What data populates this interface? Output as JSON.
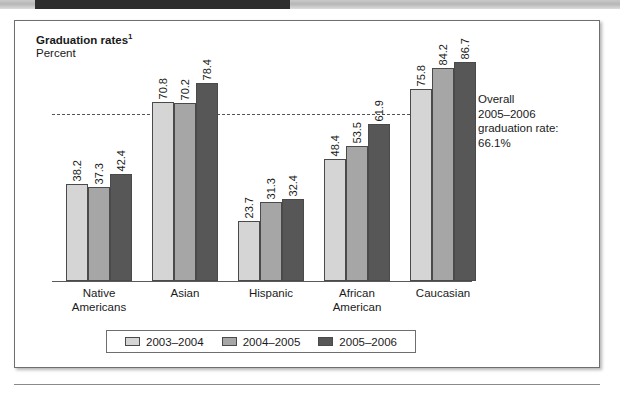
{
  "figure": {
    "title": "Graduation rates",
    "title_footnote": "1",
    "subtitle": "Percent"
  },
  "annotation": {
    "line1": "Overall",
    "line2": "2005–2006",
    "line3": "graduation rate:",
    "line4": "66.1%"
  },
  "legend": {
    "items": [
      {
        "label": "2003–2004",
        "color": "#d5d5d5"
      },
      {
        "label": "2004–2005",
        "color": "#a6a6a6"
      },
      {
        "label": "2005–2006",
        "color": "#575757"
      }
    ]
  },
  "chart_data": {
    "type": "bar",
    "subtitle": "Percent",
    "xlabel": "",
    "ylabel": "Percent",
    "ylim": [
      0,
      100
    ],
    "grid": false,
    "legend_position": "bottom",
    "categories": [
      "Native Americans",
      "Asian",
      "Hispanic",
      "African American",
      "Caucasian"
    ],
    "category_lines": [
      [
        "Native",
        "Americans"
      ],
      [
        "Asian",
        ""
      ],
      [
        "Hispanic",
        ""
      ],
      [
        "African",
        "American"
      ],
      [
        "Caucasian",
        ""
      ]
    ],
    "series": [
      {
        "name": "2003–2004",
        "color": "#d5d5d5",
        "values": [
          38.2,
          70.8,
          23.7,
          48.4,
          75.8
        ]
      },
      {
        "name": "2004–2005",
        "color": "#a6a6a6",
        "values": [
          37.3,
          70.2,
          31.3,
          53.5,
          84.2
        ]
      },
      {
        "name": "2005–2006",
        "color": "#575757",
        "values": [
          42.4,
          78.4,
          32.4,
          61.9,
          86.7
        ]
      }
    ],
    "reference_line": {
      "value": 66.1,
      "style": "dashed",
      "label": "Overall 2005–2006 graduation rate: 66.1%"
    }
  }
}
